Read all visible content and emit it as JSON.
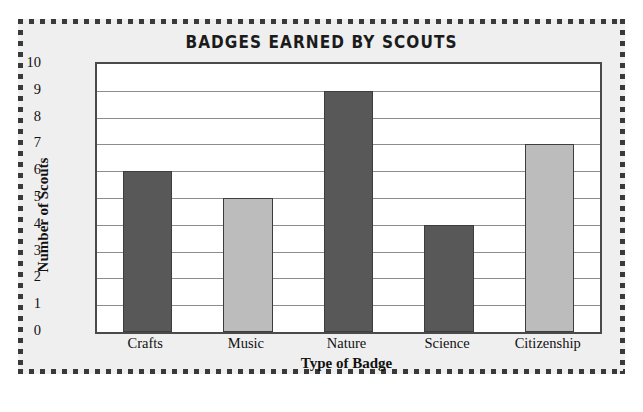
{
  "chart_data": {
    "type": "bar",
    "title": "BADGES EARNED BY SCOUTS",
    "xlabel": "Type of Badge",
    "ylabel": "Number of Scouts",
    "categories": [
      "Crafts",
      "Music",
      "Nature",
      "Science",
      "Citizenship"
    ],
    "values": [
      6,
      5,
      9,
      4,
      7
    ],
    "bar_colors": [
      "#585858",
      "#bcbcbc",
      "#585858",
      "#585858",
      "#bcbcbc"
    ],
    "ylim": [
      0,
      10
    ],
    "y_ticks": [
      10,
      9,
      8,
      7,
      6,
      5,
      4,
      3,
      2,
      1,
      0
    ],
    "grid": true,
    "legend": null
  },
  "style": {
    "background": "#efefef",
    "plot_background": "#ffffff",
    "border_color": "#3a3a3a",
    "gridline_color": "#8d8d8d",
    "dark_bar": "#585858",
    "light_bar": "#bcbcbc"
  }
}
